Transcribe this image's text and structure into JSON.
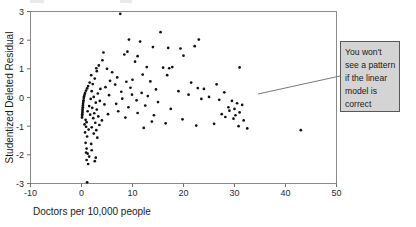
{
  "figure": {
    "background": "#ffffff",
    "frame_color": "#8a8a8a",
    "point_color": "#111111"
  },
  "annotation": {
    "name": "callout-note",
    "lines": [
      "You won't",
      "see a pattern",
      "if the linear",
      "model is",
      "correct"
    ],
    "text": "You won't see a pattern if the linear model is correct",
    "fill": "#d4d4d4",
    "border": "#585858",
    "box": {
      "x": 340,
      "y": 41,
      "width": 60,
      "height": 71
    },
    "leader_line": {
      "x1": 258,
      "y1": 94,
      "x2": 340,
      "y2": 76
    }
  },
  "chart_data": {
    "type": "scatter",
    "title": "",
    "xlabel": "Doctors per 10,000 people",
    "ylabel": "Studentized Deleted Residual",
    "xlim": [
      -10,
      50
    ],
    "ylim": [
      -3,
      3
    ],
    "xticks": [
      -10,
      0,
      10,
      20,
      30,
      40,
      50
    ],
    "yticks": [
      -3,
      -2,
      -1,
      0,
      1,
      2,
      3
    ],
    "grid": false,
    "legend": "none",
    "marker": "filled-circle",
    "series": [
      {
        "name": "Studentized deleted residuals",
        "points": [
          [
            7.6,
            2.92
          ],
          [
            15.5,
            2.28
          ],
          [
            9.3,
            2.02
          ],
          [
            23.0,
            2.02
          ],
          [
            11.5,
            1.95
          ],
          [
            22.2,
            1.79
          ],
          [
            14.0,
            1.76
          ],
          [
            17.0,
            1.73
          ],
          [
            19.4,
            1.71
          ],
          [
            9.0,
            1.6
          ],
          [
            8.4,
            1.5
          ],
          [
            20.0,
            1.46
          ],
          [
            11.0,
            1.44
          ],
          [
            4.3,
            1.57
          ],
          [
            4.1,
            1.3
          ],
          [
            10.5,
            1.25
          ],
          [
            3.4,
            1.12
          ],
          [
            2.9,
            1.02
          ],
          [
            12.8,
            1.06
          ],
          [
            17.8,
            1.06
          ],
          [
            5.0,
            1.0
          ],
          [
            16.0,
            1.04
          ],
          [
            17.2,
            1.02
          ],
          [
            31.0,
            1.05
          ],
          [
            3.0,
            0.92
          ],
          [
            6.0,
            0.88
          ],
          [
            12.0,
            0.8
          ],
          [
            16.8,
            0.78
          ],
          [
            1.9,
            0.78
          ],
          [
            7.0,
            0.7
          ],
          [
            2.6,
            0.66
          ],
          [
            10.0,
            0.62
          ],
          [
            5.6,
            0.58
          ],
          [
            8.8,
            0.55
          ],
          [
            13.5,
            0.56
          ],
          [
            21.5,
            0.52
          ],
          [
            1.6,
            0.52
          ],
          [
            2.2,
            0.47
          ],
          [
            6.6,
            0.45
          ],
          [
            26.5,
            0.46
          ],
          [
            1.3,
            0.4
          ],
          [
            4.7,
            0.36
          ],
          [
            9.6,
            0.34
          ],
          [
            22.8,
            0.33
          ],
          [
            1.1,
            0.32
          ],
          [
            3.7,
            0.3
          ],
          [
            14.6,
            0.28
          ],
          [
            24.0,
            0.3
          ],
          [
            0.9,
            0.24
          ],
          [
            2.0,
            0.22
          ],
          [
            7.8,
            0.2
          ],
          [
            19.0,
            0.22
          ],
          [
            0.7,
            0.16
          ],
          [
            3.2,
            0.14
          ],
          [
            11.8,
            0.16
          ],
          [
            28.0,
            0.18
          ],
          [
            0.6,
            0.1
          ],
          [
            5.4,
            0.08
          ],
          [
            9.9,
            0.1
          ],
          [
            21.0,
            0.1
          ],
          [
            0.5,
            0.04
          ],
          [
            2.4,
            0.02
          ],
          [
            13.0,
            0.05
          ],
          [
            25.0,
            0.02
          ],
          [
            0.45,
            -0.02
          ],
          [
            1.8,
            -0.05
          ],
          [
            8.0,
            -0.04
          ],
          [
            23.5,
            -0.05
          ],
          [
            0.4,
            -0.1
          ],
          [
            3.6,
            -0.12
          ],
          [
            10.8,
            -0.1
          ],
          [
            27.0,
            -0.08
          ],
          [
            0.35,
            -0.16
          ],
          [
            2.8,
            -0.18
          ],
          [
            15.0,
            -0.16
          ],
          [
            29.5,
            -0.12
          ],
          [
            0.3,
            -0.22
          ],
          [
            4.5,
            -0.24
          ],
          [
            6.8,
            -0.22
          ],
          [
            30.5,
            -0.2
          ],
          [
            0.28,
            -0.28
          ],
          [
            1.5,
            -0.3
          ],
          [
            12.5,
            -0.28
          ],
          [
            31.5,
            -0.26
          ],
          [
            0.25,
            -0.34
          ],
          [
            2.1,
            -0.36
          ],
          [
            9.2,
            -0.34
          ],
          [
            28.8,
            -0.34
          ],
          [
            0.22,
            -0.4
          ],
          [
            3.0,
            -0.42
          ],
          [
            17.5,
            -0.4
          ],
          [
            30.0,
            -0.4
          ],
          [
            0.2,
            -0.46
          ],
          [
            1.2,
            -0.48
          ],
          [
            7.2,
            -0.48
          ],
          [
            29.0,
            -0.46
          ],
          [
            0.18,
            -0.52
          ],
          [
            2.5,
            -0.55
          ],
          [
            11.0,
            -0.54
          ],
          [
            31.0,
            -0.52
          ],
          [
            0.15,
            -0.58
          ],
          [
            1.7,
            -0.6
          ],
          [
            5.2,
            -0.58
          ],
          [
            27.5,
            -0.58
          ],
          [
            0.12,
            -0.64
          ],
          [
            3.3,
            -0.66
          ],
          [
            14.2,
            -0.62
          ],
          [
            30.2,
            -0.62
          ],
          [
            0.1,
            -0.7
          ],
          [
            2.3,
            -0.72
          ],
          [
            8.6,
            -0.7
          ],
          [
            28.2,
            -0.68
          ],
          [
            0.8,
            -0.78
          ],
          [
            4.0,
            -0.8
          ],
          [
            19.8,
            -0.76
          ],
          [
            29.8,
            -0.74
          ],
          [
            1.0,
            -0.86
          ],
          [
            2.7,
            -0.88
          ],
          [
            13.8,
            -0.84
          ],
          [
            31.8,
            -0.8
          ],
          [
            0.6,
            -0.94
          ],
          [
            3.5,
            -0.96
          ],
          [
            16.5,
            -0.9
          ],
          [
            26.0,
            -0.92
          ],
          [
            0.9,
            -1.02
          ],
          [
            2.0,
            -1.04
          ],
          [
            22.5,
            -0.98
          ],
          [
            30.8,
            -1.0
          ],
          [
            1.4,
            -1.12
          ],
          [
            2.9,
            -1.14
          ],
          [
            12.2,
            -1.06
          ],
          [
            32.5,
            -1.08
          ],
          [
            0.7,
            -1.22
          ],
          [
            2.4,
            -1.26
          ],
          [
            43.0,
            -1.14
          ],
          [
            1.1,
            -1.36
          ],
          [
            3.1,
            -1.4
          ],
          [
            0.8,
            -1.58
          ],
          [
            1.9,
            -1.62
          ],
          [
            1.0,
            -1.78
          ],
          [
            2.0,
            -1.84
          ],
          [
            0.9,
            -1.92
          ],
          [
            1.2,
            -1.96
          ],
          [
            1.5,
            -2.06
          ],
          [
            2.8,
            -2.1
          ],
          [
            1.0,
            -2.18
          ],
          [
            2.6,
            -2.22
          ],
          [
            1.3,
            -2.32
          ],
          [
            1.1,
            -2.96
          ]
        ]
      }
    ]
  }
}
